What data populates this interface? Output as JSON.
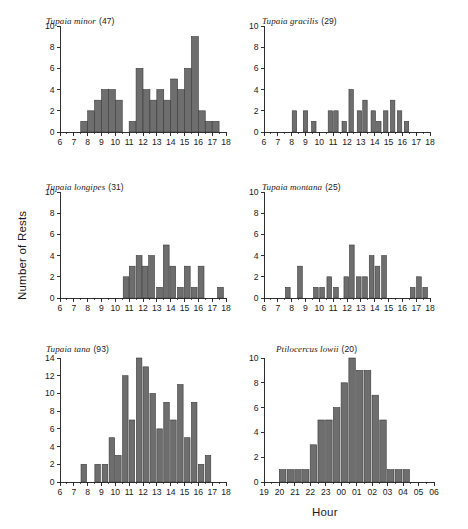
{
  "figure": {
    "ylabel": "Number of Rests",
    "xlabel": "Hour",
    "bar_color": "#6e6e6e",
    "bar_edge_color": "#3a3a3a",
    "axis_color": "#1a1a1a",
    "background": "#ffffff"
  },
  "chart_data": [
    {
      "type": "bar",
      "panel_index": 0,
      "title": "Tupaia minor  (47)",
      "species": "Tupaia minor",
      "count_label": "(47)",
      "sample_size": 47,
      "xlabel": "",
      "ylabel": "Number of Rests",
      "xlim": [
        6,
        18
      ],
      "ylim": [
        0,
        10
      ],
      "yticks": [
        0,
        2,
        4,
        6,
        8,
        10
      ],
      "xticks": [
        6,
        7,
        8,
        9,
        10,
        11,
        12,
        13,
        14,
        15,
        16,
        17,
        18
      ],
      "bin_width": 0.5,
      "grid": false,
      "legend": "none",
      "x": [
        7.75,
        8.25,
        8.75,
        9.25,
        9.75,
        10.25,
        10.75,
        11.25,
        11.75,
        12.25,
        12.75,
        13.25,
        13.75,
        14.25,
        14.75,
        15.25,
        15.75,
        16.25,
        16.75,
        17.25
      ],
      "values": [
        1,
        2,
        3,
        4,
        4,
        3,
        0,
        1,
        6,
        4,
        3,
        4,
        3,
        5,
        4,
        6,
        9,
        2,
        1,
        1
      ]
    },
    {
      "type": "bar",
      "panel_index": 1,
      "title": "Tupaia gracilis  (29)",
      "species": "Tupaia gracilis",
      "count_label": "(29)",
      "sample_size": 29,
      "xlabel": "",
      "ylabel": "",
      "xlim": [
        6,
        18
      ],
      "ylim": [
        0,
        10
      ],
      "yticks": [
        0,
        2,
        4,
        6,
        8,
        10
      ],
      "xticks": [
        6,
        7,
        8,
        9,
        10,
        11,
        12,
        13,
        14,
        15,
        16,
        17,
        18
      ],
      "bin_width": 0.32,
      "grid": false,
      "legend": "none",
      "x": [
        8.2,
        9.0,
        9.6,
        10.8,
        11.2,
        11.8,
        12.3,
        12.9,
        13.3,
        13.9,
        14.3,
        14.8,
        15.3,
        15.8,
        16.3
      ],
      "values": [
        2,
        2,
        1,
        2,
        2,
        1,
        4,
        2,
        3,
        2,
        1,
        2,
        3,
        2,
        1
      ]
    },
    {
      "type": "bar",
      "panel_index": 2,
      "title": "Tupaia longipes  (31)",
      "species": "Tupaia longipes",
      "count_label": "(31)",
      "sample_size": 31,
      "xlabel": "",
      "ylabel": "Number of Rests",
      "xlim": [
        6,
        18
      ],
      "ylim": [
        0,
        10
      ],
      "yticks": [
        0,
        2,
        4,
        6,
        8,
        10
      ],
      "xticks": [
        6,
        7,
        8,
        9,
        10,
        11,
        12,
        13,
        14,
        15,
        16,
        17,
        18
      ],
      "bin_width": 0.42,
      "grid": false,
      "legend": "none",
      "x": [
        10.78,
        11.22,
        11.72,
        12.15,
        12.62,
        13.2,
        13.68,
        14.15,
        14.7,
        15.2,
        15.7,
        16.2,
        17.6
      ],
      "values": [
        2,
        3,
        4,
        3,
        4,
        1,
        5,
        3,
        1,
        3,
        1,
        3,
        1
      ]
    },
    {
      "type": "bar",
      "panel_index": 3,
      "title": "Tupaia montana  (25)",
      "species": "Tupaia montana",
      "count_label": "(25)",
      "sample_size": 25,
      "xlabel": "",
      "ylabel": "",
      "xlim": [
        6,
        18
      ],
      "ylim": [
        0,
        10
      ],
      "yticks": [
        0,
        2,
        4,
        6,
        8,
        10
      ],
      "xticks": [
        6,
        7,
        8,
        9,
        10,
        11,
        12,
        13,
        14,
        15,
        16,
        17,
        18
      ],
      "bin_width": 0.34,
      "grid": false,
      "legend": "none",
      "x": [
        7.72,
        8.6,
        9.75,
        10.2,
        10.72,
        11.2,
        11.95,
        12.35,
        12.85,
        13.3,
        13.78,
        14.2,
        14.68,
        16.75,
        17.2,
        17.65
      ],
      "values": [
        1,
        3,
        1,
        1,
        2,
        1,
        2,
        5,
        2,
        2,
        4,
        3,
        4,
        1,
        2,
        1
      ]
    },
    {
      "type": "bar",
      "panel_index": 4,
      "title": "Tupaia tana  (93)",
      "species": "Tupaia tana",
      "count_label": "(93)",
      "sample_size": 93,
      "xlabel": "",
      "ylabel": "",
      "xlim": [
        6,
        18
      ],
      "ylim": [
        0,
        14
      ],
      "yticks": [
        0,
        2,
        4,
        6,
        8,
        10,
        12,
        14
      ],
      "xticks": [
        6,
        7,
        8,
        9,
        10,
        11,
        12,
        13,
        14,
        15,
        16,
        17,
        18
      ],
      "bin_width": 0.4,
      "grid": false,
      "legend": "none",
      "x": [
        7.72,
        8.72,
        9.25,
        9.75,
        10.22,
        10.72,
        11.2,
        11.72,
        12.2,
        12.7,
        13.2,
        13.7,
        14.2,
        14.7,
        15.2,
        15.7,
        16.2,
        16.7
      ],
      "values": [
        2,
        2,
        2,
        5,
        3,
        12,
        7,
        14,
        13,
        10,
        6,
        9,
        7,
        11,
        5,
        9,
        2,
        3
      ]
    },
    {
      "type": "bar",
      "panel_index": 5,
      "title": "Ptilocercus lowii  (20)",
      "species": "Ptilocercus lowii",
      "count_label": "(20)",
      "sample_size": 20,
      "xlabel": "Hour",
      "ylabel": "",
      "xlim": [
        19,
        30
      ],
      "ylim": [
        0,
        10
      ],
      "yticks": [
        0,
        2,
        4,
        6,
        8,
        10
      ],
      "xticks": [
        19,
        20,
        21,
        22,
        23,
        24,
        25,
        26,
        27,
        28,
        29,
        30
      ],
      "xticklabels": [
        "19",
        "20",
        "21",
        "22",
        "23",
        "00",
        "01",
        "02",
        "03",
        "04",
        "05",
        "06"
      ],
      "bin_width": 0.42,
      "grid": false,
      "legend": "none",
      "x": [
        20.2,
        20.7,
        21.2,
        21.7,
        22.2,
        22.7,
        23.2,
        23.7,
        24.2,
        24.7,
        25.2,
        25.7,
        26.2,
        26.7,
        27.2,
        27.7,
        28.2
      ],
      "values": [
        1,
        1,
        1,
        1,
        3,
        5,
        5,
        6,
        8,
        10,
        9,
        9,
        7,
        5,
        1,
        1,
        1
      ]
    }
  ]
}
